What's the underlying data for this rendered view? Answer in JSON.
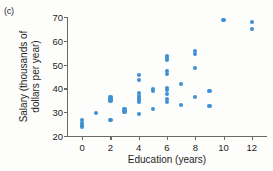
{
  "panel": {
    "label": "(c)"
  },
  "chart_data": {
    "type": "scatter",
    "title": "",
    "xlabel": "Education (years)",
    "ylabel": "Salary (thousands of dollars per year)",
    "xlim": [
      -1,
      13
    ],
    "ylim": [
      20,
      70
    ],
    "xticks": [
      0,
      2,
      4,
      6,
      8,
      10,
      12
    ],
    "yticks": [
      20,
      30,
      40,
      50,
      60,
      70
    ],
    "grid": false,
    "legend": null,
    "marker_color": "#3f90d2",
    "series": [
      {
        "name": "employees",
        "points": [
          [
            0,
            26.8
          ],
          [
            0,
            25.4
          ],
          [
            0,
            24.6
          ],
          [
            0,
            24.0
          ],
          [
            1,
            29.7
          ],
          [
            2,
            36.3
          ],
          [
            2,
            35.6
          ],
          [
            2,
            34.9
          ],
          [
            2,
            26.8
          ],
          [
            3,
            31.2
          ],
          [
            3,
            30.3
          ],
          [
            4,
            45.6
          ],
          [
            4,
            43.6
          ],
          [
            4,
            38.0
          ],
          [
            4,
            36.8
          ],
          [
            4,
            36.0
          ],
          [
            4,
            35.2
          ],
          [
            4,
            34.4
          ],
          [
            4,
            29.1
          ],
          [
            5,
            39.6
          ],
          [
            5,
            38.9
          ],
          [
            5,
            31.4
          ],
          [
            6,
            53.7
          ],
          [
            6,
            52.8
          ],
          [
            6,
            52.0
          ],
          [
            6,
            47.2
          ],
          [
            6,
            46.2
          ],
          [
            6,
            40.3
          ],
          [
            6,
            39.2
          ],
          [
            6,
            37.8
          ],
          [
            6,
            35.6
          ],
          [
            6,
            34.4
          ],
          [
            7,
            41.7
          ],
          [
            7,
            32.9
          ],
          [
            8,
            55.6
          ],
          [
            8,
            54.6
          ],
          [
            8,
            48.5
          ],
          [
            8,
            36.5
          ],
          [
            9,
            38.8
          ],
          [
            9,
            32.7
          ],
          [
            10,
            68.9
          ],
          [
            12,
            67.9
          ],
          [
            12,
            65.1
          ]
        ]
      }
    ]
  }
}
